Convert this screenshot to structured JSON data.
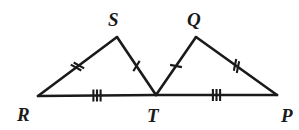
{
  "figure": {
    "background_color": "#ffffff",
    "stroke_color": "#1a1a1a",
    "width": 299,
    "height": 130
  },
  "vertices": [
    {
      "id": "R",
      "label": "R",
      "x": 38,
      "y": 96,
      "label_x": 17,
      "label_y": 121
    },
    {
      "id": "S",
      "label": "S",
      "x": 117,
      "y": 37,
      "label_x": 108,
      "label_y": 26
    },
    {
      "id": "T",
      "label": "T",
      "x": 156,
      "y": 95,
      "label_x": 147,
      "label_y": 122
    },
    {
      "id": "Q",
      "label": "Q",
      "x": 196,
      "y": 37,
      "label_x": 187,
      "label_y": 26
    },
    {
      "id": "P",
      "label": "P",
      "x": 277,
      "y": 95,
      "label_x": 281,
      "label_y": 122
    }
  ],
  "segments": [
    {
      "id": "RS",
      "from": "R",
      "to": "S",
      "ticks": 2,
      "tick_style": "slash"
    },
    {
      "id": "ST",
      "from": "S",
      "to": "T",
      "ticks": 1,
      "tick_style": "slash"
    },
    {
      "id": "TQ",
      "from": "T",
      "to": "Q",
      "ticks": 1,
      "tick_style": "slash"
    },
    {
      "id": "QP",
      "from": "Q",
      "to": "P",
      "ticks": 2,
      "tick_style": "slash"
    },
    {
      "id": "RT",
      "from": "R",
      "to": "T",
      "ticks": 3,
      "tick_style": "vertical"
    },
    {
      "id": "TP",
      "from": "T",
      "to": "P",
      "ticks": 3,
      "tick_style": "vertical"
    }
  ],
  "triangles": [
    {
      "id": "RST",
      "vertices": [
        "R",
        "S",
        "T"
      ]
    },
    {
      "id": "PQT",
      "vertices": [
        "T",
        "Q",
        "P"
      ]
    }
  ]
}
